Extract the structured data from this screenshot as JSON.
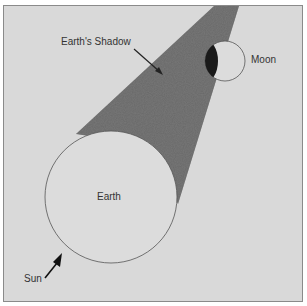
{
  "diagram": {
    "labels": {
      "shadow": "Earth's Shadow",
      "moon": "Moon",
      "earth": "Earth",
      "sun": "Sun"
    },
    "colors": {
      "background": "#d9d9d9",
      "shadow": "#5a5a5a",
      "umbra_on_moon": "#1a1a1a",
      "outline": "#555555"
    }
  }
}
